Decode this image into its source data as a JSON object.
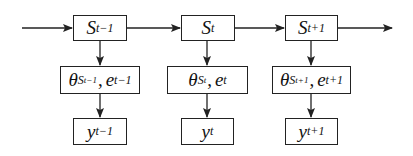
{
  "diagram": {
    "type": "state-space-flow",
    "columns": [
      {
        "state": {
          "symbol": "S",
          "subscript": "t−1"
        },
        "params": {
          "theta": "θ",
          "theta_sub": "S",
          "theta_subsub": "t−1",
          "error": "e",
          "error_sub": "t−1"
        },
        "output": {
          "symbol": "y",
          "subscript": "t−1"
        }
      },
      {
        "state": {
          "symbol": "S",
          "subscript": "t"
        },
        "params": {
          "theta": "θ",
          "theta_sub": "S",
          "theta_subsub": "t",
          "error": "e",
          "error_sub": "t"
        },
        "output": {
          "symbol": "y",
          "subscript": "t"
        }
      },
      {
        "state": {
          "symbol": "S",
          "subscript": "t+1"
        },
        "params": {
          "theta": "θ",
          "theta_sub": "S",
          "theta_subsub": "t+1",
          "error": "e",
          "error_sub": "t+1"
        },
        "output": {
          "symbol": "y",
          "subscript": "t+1"
        }
      }
    ],
    "separator": ",",
    "colors": {
      "stroke": "#222222",
      "background": "#ffffff"
    }
  }
}
